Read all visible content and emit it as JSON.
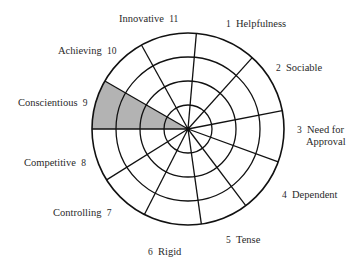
{
  "diagram": {
    "type": "polar-wheel",
    "center": [
      188,
      129
    ],
    "rings": [
      24,
      48,
      72,
      96
    ],
    "spoke_angles_deg": [
      85,
      48,
      11,
      -20,
      -53,
      -82,
      -117,
      -148,
      180,
      150,
      119
    ],
    "shaded_sector": {
      "from_deg": 150,
      "to_deg": 180,
      "label": "Conscientious 9",
      "fill": "#b3b3b3"
    },
    "line_color": "#111111"
  },
  "labels": [
    {
      "id": "1",
      "text": "Helpfulness",
      "number": "1",
      "order": "num-first",
      "x": 226,
      "y": 18
    },
    {
      "id": "2",
      "text": "Sociable",
      "number": "2",
      "order": "num-first",
      "x": 276,
      "y": 62
    },
    {
      "id": "3",
      "text": "Need for",
      "text2": "Approval",
      "number": "3",
      "order": "num-first",
      "x": 297,
      "y": 124
    },
    {
      "id": "4",
      "text": "Dependent",
      "number": "4",
      "order": "num-first",
      "x": 282,
      "y": 189
    },
    {
      "id": "5",
      "text": "Tense",
      "number": "5",
      "order": "num-first",
      "x": 226,
      "y": 234
    },
    {
      "id": "6",
      "text": "Rigid",
      "number": "6",
      "order": "num-first",
      "x": 148,
      "y": 246
    },
    {
      "id": "7",
      "text": "Controlling",
      "number": "7",
      "order": "text-first",
      "x": 53,
      "y": 207
    },
    {
      "id": "8",
      "text": "Competitive",
      "number": "8",
      "order": "text-first",
      "x": 24,
      "y": 157
    },
    {
      "id": "9",
      "text": "Conscientious",
      "number": "9",
      "order": "text-first",
      "x": 18,
      "y": 97
    },
    {
      "id": "10",
      "text": "Achieving",
      "number": "10",
      "order": "text-first",
      "x": 58,
      "y": 45
    },
    {
      "id": "11",
      "text": "Innovative",
      "number": "11",
      "order": "text-first",
      "x": 119,
      "y": 13
    }
  ]
}
